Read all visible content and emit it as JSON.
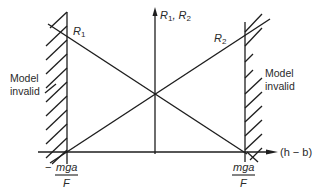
{
  "diagram": {
    "type": "force-balance-diagram",
    "vertical_axis_label": "R1, R2",
    "horizontal_axis_label": "(h − b)",
    "lines": [
      {
        "name": "R1",
        "label": "R1",
        "direction": "decreasing"
      },
      {
        "name": "R2",
        "label": "R2",
        "direction": "increasing"
      }
    ],
    "left_region_label_line1": "Model",
    "left_region_label_line2": "invalid",
    "right_region_label_line1": "Model",
    "right_region_label_line2": "invalid",
    "left_tick_sign": "−",
    "left_tick_numerator": "mga",
    "left_tick_denominator": "F",
    "right_tick_numerator": "mga",
    "right_tick_denominator": "F",
    "r1_label": "R",
    "r1_sub": "1",
    "r2_label": "R",
    "r2_sub": "2",
    "axis_label_r": "R",
    "axis_label_sub1": "1",
    "axis_label_sep": ", R",
    "axis_label_sub2": "2",
    "h_axis_text": "(h − b)",
    "line_color": "#1e1e1e"
  }
}
